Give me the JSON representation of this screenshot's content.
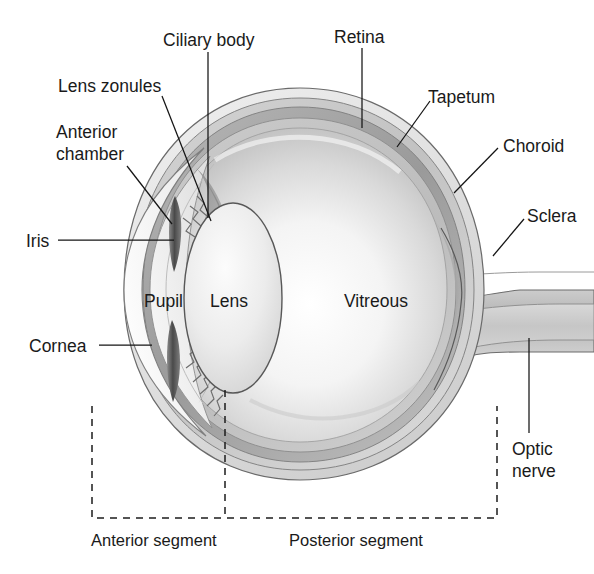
{
  "diagram": {
    "background_color": "#ffffff",
    "ink_color": "#1a1a1a"
  },
  "labels": {
    "ciliary_body": "Ciliary body",
    "retina": "Retina",
    "tapetum": "Tapetum",
    "choroid": "Choroid",
    "sclera": "Sclera",
    "lens_zonules": "Lens zonules",
    "anterior_chamber_line1": "Anterior",
    "anterior_chamber_line2": "chamber",
    "iris": "Iris",
    "cornea": "Cornea",
    "pupil": "Pupil",
    "lens": "Lens",
    "vitreous": "Vitreous",
    "optic_nerve_line1": "Optic",
    "optic_nerve_line2": "nerve",
    "anterior_segment": "Anterior segment",
    "posterior_segment": "Posterior segment"
  }
}
